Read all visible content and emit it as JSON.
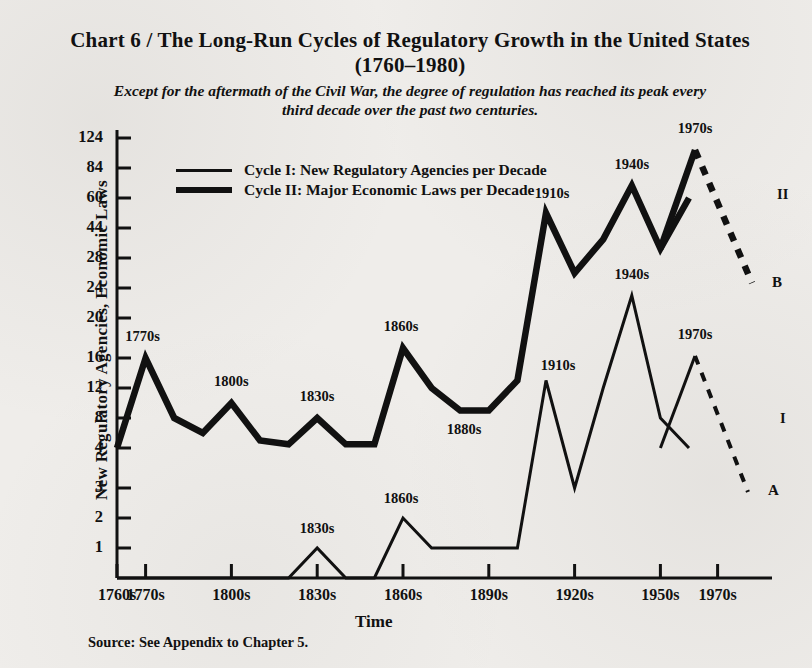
{
  "title": "Chart 6 / The Long-Run Cycles of Regulatory Growth in the United States (1760–1980)",
  "subtitle": "Except for the aftermath of the Civil War, the degree of regulation has reached its peak every third decade over the past two centuries.",
  "source": "Source: See Appendix to Chapter 5.",
  "legend": {
    "series1": "Cycle I: New Regulatory Agencies per Decade",
    "series2": "Cycle II: Major Economic Laws per Decade"
  },
  "series_tags": {
    "cycle1_tag": "I",
    "cycle2_tag": "II",
    "endpoint_a": "A",
    "endpoint_b": "B"
  },
  "chart_data": {
    "type": "line",
    "title": "Chart 6 / The Long-Run Cycles of Regulatory Growth in the United States (1760–1980)",
    "subtitle": "Except for the aftermath of the Civil War, the degree of regulation has reached its peak every third decade over the past two centuries.",
    "xlabel": "Time",
    "ylabel": "New Regulatory Agencies, Economic Laws",
    "grid": false,
    "legend_position": "upper-left-inside",
    "yticks": [
      1,
      2,
      3,
      4,
      8,
      12,
      16,
      20,
      24,
      28,
      44,
      60,
      84,
      124
    ],
    "yscale": "nonlinear-ordinal",
    "xticks": [
      "1760s",
      "1770s",
      "1800s",
      "1830s",
      "1860s",
      "1890s",
      "1920s",
      "1950s",
      "1970s"
    ],
    "x": [
      "1760s",
      "1770s",
      "1780s",
      "1790s",
      "1800s",
      "1810s",
      "1820s",
      "1830s",
      "1840s",
      "1850s",
      "1860s",
      "1870s",
      "1880s",
      "1890s",
      "1900s",
      "1910s",
      "1920s",
      "1930s",
      "1940s",
      "1950s",
      "1960s",
      "1970s"
    ],
    "series": [
      {
        "name": "Cycle I: New Regulatory Agencies per Decade",
        "stroke": "thin",
        "values": [
          0,
          0,
          0,
          0,
          0,
          0,
          0,
          1,
          0,
          0,
          2,
          1,
          1,
          1,
          1,
          13,
          3,
          12,
          23,
          8,
          4,
          18
        ]
      },
      {
        "name": "Cycle II: Major Economic Laws per Decade",
        "stroke": "thick",
        "values": [
          4,
          16,
          8,
          6,
          10,
          5,
          4.5,
          8,
          4.5,
          4.5,
          17,
          12,
          9,
          9,
          13,
          52,
          26,
          38,
          70,
          33,
          60,
          100
        ]
      }
    ],
    "annotations": [
      {
        "series": "Cycle II",
        "x": "1770s",
        "label": "1770s"
      },
      {
        "series": "Cycle II",
        "x": "1800s",
        "label": "1800s"
      },
      {
        "series": "Cycle II",
        "x": "1830s",
        "label": "1830s"
      },
      {
        "series": "Cycle II",
        "x": "1860s",
        "label": "1860s"
      },
      {
        "series": "Cycle II",
        "x": "1880s",
        "label": "1880s"
      },
      {
        "series": "Cycle II",
        "x": "1910s",
        "label": "1910s"
      },
      {
        "series": "Cycle II",
        "x": "1940s",
        "label": "1940s"
      },
      {
        "series": "Cycle II",
        "x": "1970s",
        "label": "1970s"
      },
      {
        "series": "Cycle I",
        "x": "1830s",
        "label": "1830s"
      },
      {
        "series": "Cycle I",
        "x": "1860s",
        "label": "1860s"
      },
      {
        "series": "Cycle I",
        "x": "1910s",
        "label": "1910s"
      },
      {
        "series": "Cycle I",
        "x": "1940s",
        "label": "1940s"
      },
      {
        "series": "Cycle I",
        "x": "1970s",
        "label": "1970s"
      }
    ],
    "projections": [
      {
        "from_series": "Cycle II",
        "tag": "II",
        "endpoint": "B",
        "style": "dashed-decline"
      },
      {
        "from_series": "Cycle I",
        "tag": "I",
        "endpoint": "A",
        "style": "dashed-decline"
      }
    ]
  },
  "ytick_labels": [
    "124",
    "84",
    "60",
    "44",
    "28",
    "24",
    "20",
    "16",
    "12",
    "8",
    "4",
    "3",
    "2",
    "1"
  ],
  "xtick_labels": [
    "1760s",
    "1770s",
    "1800s",
    "1830s",
    "1860s",
    "1890s",
    "1920s",
    "1950s",
    "1970s"
  ],
  "colors": {
    "ink": "#111111",
    "paper": "#efedea"
  }
}
